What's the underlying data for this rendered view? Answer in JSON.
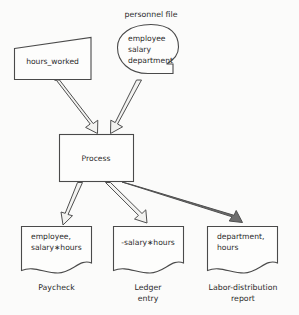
{
  "diagram": {
    "type": "data-flow-diagram",
    "background_color": "#fbfbfa",
    "line_color": "#4a4a4a",
    "text_color": "#2b2b2b",
    "inputs": [
      {
        "id": "hours-worked",
        "shape": "slanted-card",
        "label": "hours_worked",
        "caption": ""
      },
      {
        "id": "personnel-file",
        "shape": "rounded-file-notched",
        "caption": "personnel file",
        "lines": [
          "employee",
          "salary",
          "department"
        ]
      }
    ],
    "process": {
      "id": "process",
      "shape": "rectangle",
      "label": "Process"
    },
    "outputs": [
      {
        "id": "paycheck",
        "shape": "document-wavy",
        "lines": [
          "employee,",
          "salary∗hours"
        ],
        "caption": "Paycheck"
      },
      {
        "id": "ledger-entry",
        "shape": "document-wavy",
        "lines": [
          "-salary∗hours"
        ],
        "caption_lines": [
          "Ledger",
          "entry"
        ],
        "caption": "Ledger entry"
      },
      {
        "id": "labor-distribution-report",
        "shape": "document-wavy",
        "lines": [
          "department,",
          "hours"
        ],
        "caption_lines": [
          "Labor-distribution",
          "report"
        ],
        "caption": "Labor-distribution report"
      }
    ],
    "flows": [
      {
        "from": "hours-worked",
        "to": "process",
        "style": "outlined-arrow"
      },
      {
        "from": "personnel-file",
        "to": "process",
        "style": "outlined-arrow"
      },
      {
        "from": "process",
        "to": "paycheck",
        "style": "outlined-arrow"
      },
      {
        "from": "process",
        "to": "ledger-entry",
        "style": "outlined-arrow"
      },
      {
        "from": "process",
        "to": "labor-distribution-report",
        "style": "filled-arrow"
      }
    ]
  },
  "labels": {
    "personnel_file_caption": "personnel file",
    "personnel_file_line1": "employee",
    "personnel_file_line2": "salary",
    "personnel_file_line3": "department",
    "hours_worked": "hours_worked",
    "process": "Process",
    "paycheck_line1": "employee,",
    "paycheck_line2": "salary∗hours",
    "paycheck_caption": "Paycheck",
    "ledger_line1": "-salary∗hours",
    "ledger_caption_line1": "Ledger",
    "ledger_caption_line2": "entry",
    "labor_line1": "department,",
    "labor_line2": "hours",
    "labor_caption_line1": "Labor-distribution",
    "labor_caption_line2": "report"
  }
}
